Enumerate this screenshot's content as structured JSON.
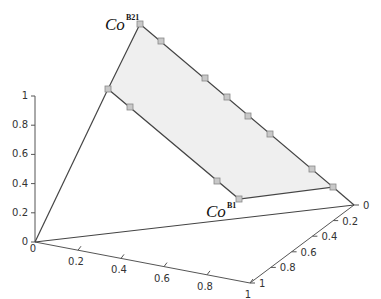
{
  "chart_data": {
    "type": "scatter",
    "title": "",
    "axes": {
      "z": {
        "ticks": [
          "0",
          "0.2",
          "0.4",
          "0.6",
          "0.8",
          "1"
        ],
        "range": [
          0,
          1
        ]
      },
      "x": {
        "ticks": [
          "0",
          "0.2",
          "0.4",
          "0.6",
          "0.8",
          "1"
        ],
        "range": [
          0,
          1
        ]
      },
      "y": {
        "ticks": [
          "0",
          "0.2",
          "0.4",
          "0.6",
          "0.8",
          "1"
        ],
        "range": [
          0,
          1
        ]
      }
    },
    "labels": {
      "top": {
        "base": "Co",
        "sup": "B21"
      },
      "bottom": {
        "base": "Co",
        "sup": "B1"
      }
    },
    "colors": {
      "fill": "#efefef",
      "marker": "#c8c8c8",
      "line": "#444444"
    },
    "region_vertex_count": 4,
    "marker_count": 12
  }
}
